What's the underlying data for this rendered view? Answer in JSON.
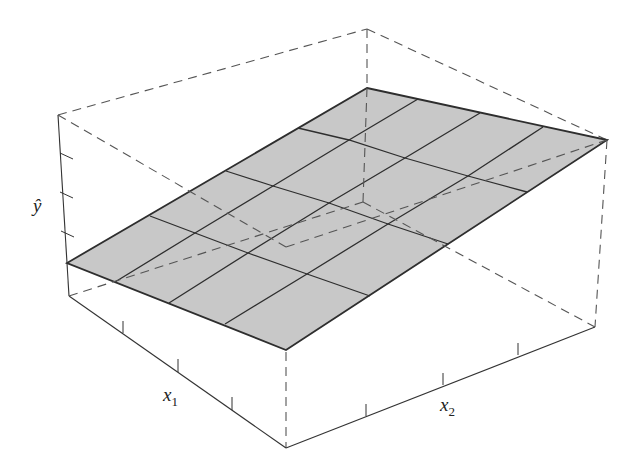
{
  "chart_data": {
    "type": "surface3d",
    "title": "",
    "xlabel": "x1",
    "ylabel": "x2",
    "zlabel": "ŷ",
    "axes": {
      "x1": {
        "label": "x",
        "subscript": "1",
        "ticks": 3
      },
      "x2": {
        "label": "x",
        "subscript": "2",
        "ticks": 3
      },
      "yhat": {
        "label": "ŷ",
        "ticks": 3
      }
    },
    "grid_divisions": [
      4,
      4
    ],
    "surface_color": "#c8c8c8",
    "line_color": "#2e2e2e",
    "grid": false,
    "legend": false
  },
  "geometry": {
    "box": {
      "top_back": [
        367,
        29
      ],
      "top_left": [
        58,
        115
      ],
      "top_right": [
        607,
        140
      ],
      "top_front": [
        286,
        247
      ],
      "bottom_left": [
        69,
        296
      ],
      "bottom_front": [
        286,
        448
      ],
      "bottom_right": [
        595,
        327
      ],
      "bottom_back": [
        363,
        202
      ]
    },
    "surface": {
      "rows": [
        [
          [
            367,
            88
          ],
          [
            418,
            99
          ],
          [
            480,
            113
          ],
          [
            543,
            127
          ],
          [
            607,
            140
          ]
        ],
        [
          [
            298,
            128
          ],
          [
            349,
            140
          ],
          [
            405,
            158
          ],
          [
            468,
            176
          ],
          [
            527,
            192
          ]
        ],
        [
          [
            226,
            171
          ],
          [
            273,
            186
          ],
          [
            329,
            203
          ],
          [
            388,
            224
          ],
          [
            448,
            244
          ]
        ],
        [
          [
            150,
            216
          ],
          [
            195,
            233
          ],
          [
            248,
            253
          ],
          [
            307,
            274
          ],
          [
            370,
            296
          ]
        ],
        [
          [
            67,
            263
          ],
          [
            115,
            282
          ],
          [
            169,
            303
          ],
          [
            225,
            324
          ],
          [
            286,
            350
          ]
        ]
      ]
    },
    "yhat_ticks": [
      [
        60,
        153,
        73,
        159
      ],
      [
        60,
        192,
        73,
        198
      ],
      [
        61,
        231,
        74,
        237
      ]
    ],
    "x1_ticks": [
      [
        123,
        321,
        123,
        333
      ],
      [
        178,
        359,
        178,
        372
      ],
      [
        232,
        397,
        232,
        410
      ]
    ],
    "x2_ticks": [
      [
        366,
        404,
        366,
        416
      ],
      [
        443,
        373,
        443,
        385
      ],
      [
        518,
        343,
        518,
        355
      ]
    ],
    "labels": {
      "yhat": {
        "text": "y",
        "hat": "^",
        "x": 33,
        "y": 212
      },
      "x1": {
        "text": "x",
        "sub": "1",
        "x": 163,
        "y": 401
      },
      "x2": {
        "text": "x",
        "sub": "2",
        "x": 440,
        "y": 411
      }
    }
  }
}
